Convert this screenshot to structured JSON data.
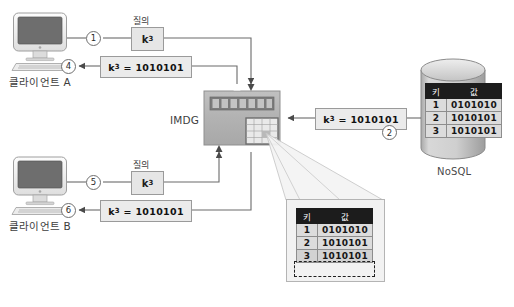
{
  "diagram": {
    "clients": [
      {
        "id": "a",
        "label": "클라이언트 A",
        "icon": "desktop-computer-icon"
      },
      {
        "id": "b",
        "label": "클라이언트 B",
        "icon": "desktop-computer-icon"
      }
    ],
    "imdg": {
      "label": "IMDG",
      "icon": "server-rack-icon"
    },
    "nosql": {
      "label": "NoSQL",
      "icon": "database-cylinder-icon"
    },
    "query_caption": "질의",
    "key_token": "k",
    "key_subscript": "3",
    "result_text": "= 1010101",
    "steps": [
      {
        "n": "1",
        "desc": "client-a-query"
      },
      {
        "n": "2",
        "desc": "nosql-response"
      },
      {
        "n": "3",
        "desc": "imdg-cache-store"
      },
      {
        "n": "4",
        "desc": "client-a-result"
      },
      {
        "n": "5",
        "desc": "client-b-query"
      },
      {
        "n": "6",
        "desc": "client-b-result"
      }
    ],
    "tables": {
      "nosql": {
        "headers": [
          "키",
          "값"
        ],
        "rows": [
          {
            "key": "1",
            "value": "0101010"
          },
          {
            "key": "2",
            "value": "1010101"
          },
          {
            "key": "3",
            "value": "1010101"
          }
        ]
      },
      "imdg_callout": {
        "headers": [
          "키",
          "값"
        ],
        "rows": [
          {
            "key": "1",
            "value": "0101010"
          },
          {
            "key": "2",
            "value": "1010101"
          },
          {
            "key": "3",
            "value": "1010101"
          }
        ],
        "highlighted_row_index": 2
      }
    },
    "colors": {
      "line": "#6b6b6b",
      "box_fill": "#e6e6e6",
      "box_border": "#9a9a9a",
      "table_header_bg": "#1c1c1c",
      "table_cell_bg": "#dcdcdc",
      "imdg_body": "#b4b4b4",
      "nosql_body": "#c9c9c9",
      "background": "#ffffff"
    }
  }
}
